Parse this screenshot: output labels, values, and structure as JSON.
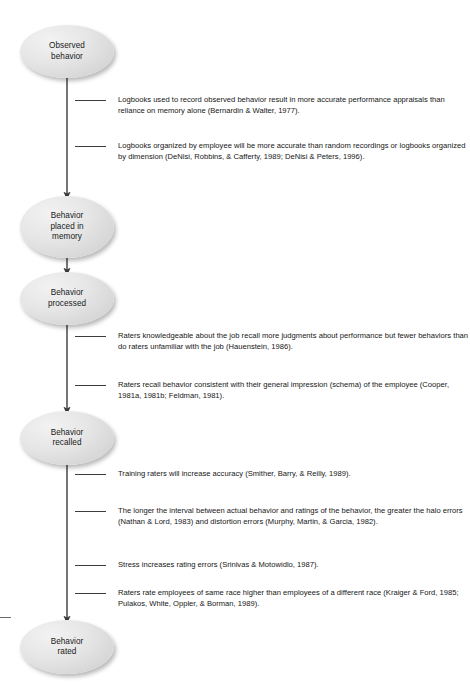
{
  "diagram": {
    "node_fill": "#e2e2e2",
    "line_color": "#3c3c3c",
    "text_color": "#161616"
  },
  "nodes": [
    {
      "id": "observed-behavior",
      "label": "Observed\nbehavior"
    },
    {
      "id": "behavior-placed",
      "label": "Behavior\nplaced in\nmemory"
    },
    {
      "id": "behavior-processed",
      "label": "Behavior\nprocessed"
    },
    {
      "id": "behavior-recalled",
      "label": "Behavior\nrecalled"
    },
    {
      "id": "behavior-rated",
      "label": "Behavior\nrated"
    }
  ],
  "notes": [
    {
      "id": "note-logbooks-record",
      "text": "Logbooks used to record observed behavior result in more accurate performance appraisals than reliance on memory alone (Bernardin & Walter, 1977)."
    },
    {
      "id": "note-logbooks-organized",
      "text": "Logbooks organized by employee will be more accurate than random recordings or logbooks organized by dimension (DeNisi, Robbins, & Cafferty, 1989; DeNisi & Peters, 1996)."
    },
    {
      "id": "note-raters-knowledgeable",
      "text": "Raters knowledgeable about the job recall more judgments about performance but fewer behaviors than do raters unfamiliar with the job (Hauenstein, 1986)."
    },
    {
      "id": "note-raters-recall-schema",
      "text": "Raters recall behavior consistent with their general impression (schema) of the employee (Cooper, 1981a, 1981b; Feldman, 1981)."
    },
    {
      "id": "note-training-raters",
      "text": "Training raters will increase accuracy (Smither, Barry, & Reilly, 1989)."
    },
    {
      "id": "note-interval-halo",
      "text": "The longer the interval between actual behavior and ratings of the behavior, the greater the halo errors (Nathan & Lord, 1983) and distortion errors (Murphy, Martin, & Garcia, 1982)."
    },
    {
      "id": "note-stress",
      "text": "Stress increases rating errors (Srinivas & Motowidlo, 1987)."
    },
    {
      "id": "note-same-race",
      "text": "Raters rate employees of same race higher than employees of a different race (Kraiger & Ford, 1985; Pulakos, White, Oppler, & Borman, 1989)."
    }
  ]
}
